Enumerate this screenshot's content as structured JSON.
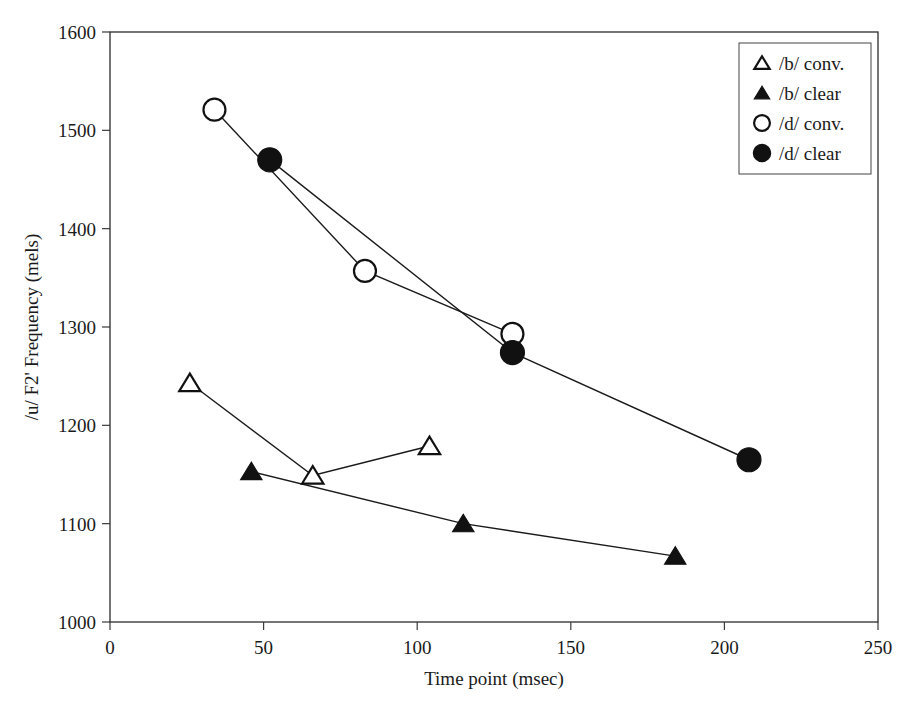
{
  "chart_data": {
    "type": "line",
    "title": "",
    "xlabel": "Time point (msec)",
    "ylabel": "/u/ F2' Frequency (mels)",
    "xlim": [
      0,
      250
    ],
    "ylim": [
      1000,
      1600
    ],
    "xticks": [
      0,
      50,
      100,
      150,
      200,
      250
    ],
    "yticks": [
      1000,
      1100,
      1200,
      1300,
      1400,
      1500,
      1600
    ],
    "grid": false,
    "legend_position": "top-right",
    "series": [
      {
        "name": "/b/ conv.",
        "marker": "open-triangle",
        "x": [
          26,
          66,
          104
        ],
        "y": [
          1243,
          1149,
          1179
        ]
      },
      {
        "name": "/b/ clear",
        "marker": "filled-triangle",
        "x": [
          46,
          115,
          184
        ],
        "y": [
          1153,
          1100,
          1067
        ]
      },
      {
        "name": "/d/ conv.",
        "marker": "open-circle",
        "x": [
          34,
          83,
          131
        ],
        "y": [
          1521,
          1357,
          1293
        ]
      },
      {
        "name": "/d/ clear",
        "marker": "filled-circle",
        "x": [
          52,
          131,
          208
        ],
        "y": [
          1470,
          1274,
          1165
        ]
      }
    ]
  },
  "axes": {
    "x_tick_labels": [
      "0",
      "50",
      "100",
      "150",
      "200",
      "250"
    ],
    "y_tick_labels": [
      "1000",
      "1100",
      "1200",
      "1300",
      "1400",
      "1500",
      "1600"
    ],
    "x_axis_title": "Time point (msec)",
    "y_axis_title": "/u/ F2' Frequency (mels)"
  },
  "legend": {
    "entries": [
      {
        "label": "/b/ conv.",
        "marker": "open-triangle"
      },
      {
        "label": "/b/ clear",
        "marker": "filled-triangle"
      },
      {
        "label": "/d/ conv.",
        "marker": "open-circle"
      },
      {
        "label": "/d/ clear",
        "marker": "filled-circle"
      }
    ]
  },
  "colors": {
    "ink": "#111111",
    "frame": "#2b2b2b",
    "background": "#ffffff"
  }
}
